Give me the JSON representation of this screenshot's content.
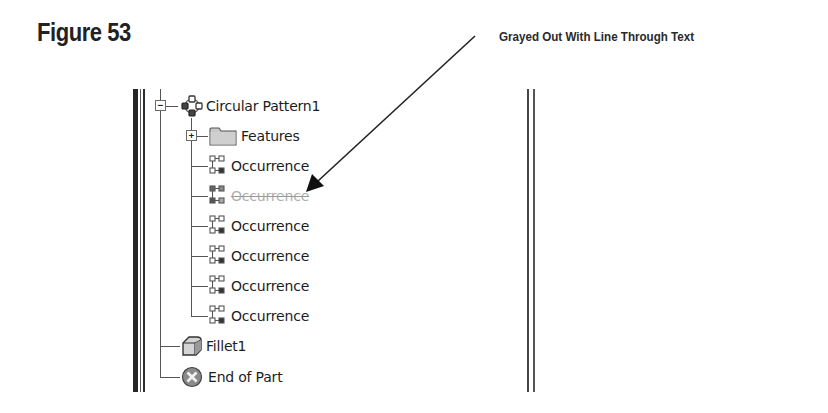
{
  "figure": {
    "title": "Figure 53"
  },
  "annotation": {
    "text": "Grayed Out With Line Through Text",
    "arrow": {
      "from": [
        475,
        36
      ],
      "to": [
        308,
        190
      ]
    }
  },
  "browser_tree": {
    "root": {
      "label": "Circular Pattern1",
      "icon": "circular-pattern-icon",
      "expanded": true,
      "children": [
        {
          "label": "Features",
          "icon": "folder-icon",
          "expanded": false
        },
        {
          "label": "Occurrence",
          "icon": "occurrence-icon",
          "suppressed": false
        },
        {
          "label": "Occurrence",
          "icon": "occurrence-icon",
          "suppressed": true
        },
        {
          "label": "Occurrence",
          "icon": "occurrence-icon",
          "suppressed": false
        },
        {
          "label": "Occurrence",
          "icon": "occurrence-icon",
          "suppressed": false
        },
        {
          "label": "Occurrence",
          "icon": "occurrence-icon",
          "suppressed": false
        },
        {
          "label": "Occurrence",
          "icon": "occurrence-icon",
          "suppressed": false
        }
      ]
    },
    "siblings": [
      {
        "label": "Fillet1",
        "icon": "fillet-icon"
      },
      {
        "label": "End of Part",
        "icon": "end-of-part-icon"
      }
    ]
  },
  "colors": {
    "text": "#1c1c1c",
    "disabled_text": "#b0b0b0",
    "bar": "#2b2b2b"
  }
}
